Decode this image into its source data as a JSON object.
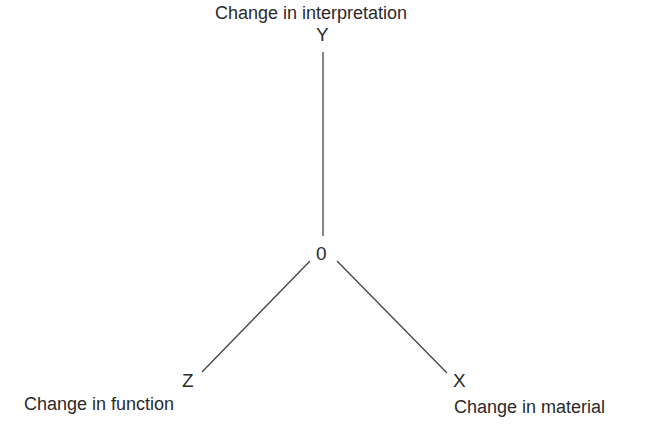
{
  "diagram": {
    "origin_label": "0",
    "axes": [
      {
        "id": "y",
        "letter": "Y",
        "label": "Change in interpretation",
        "direction": "up"
      },
      {
        "id": "z",
        "letter": "Z",
        "label": "Change in function",
        "direction": "down-left"
      },
      {
        "id": "x",
        "letter": "X",
        "label": "Change in material",
        "direction": "down-right"
      }
    ],
    "line_color": "#444444"
  }
}
